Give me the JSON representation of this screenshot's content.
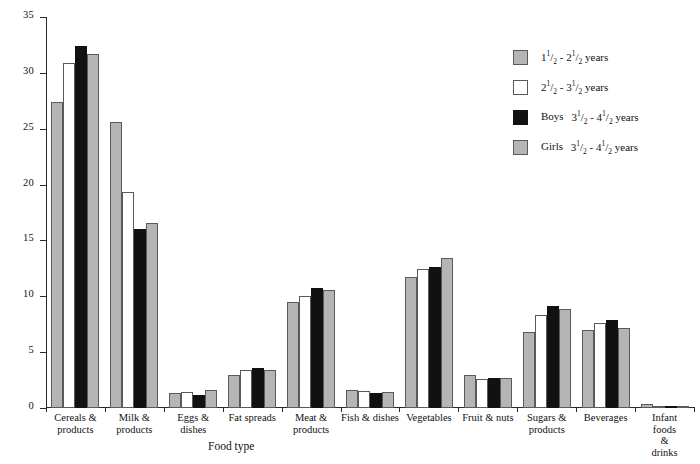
{
  "chart_data": {
    "type": "bar",
    "title": "",
    "xlabel": "Food type",
    "ylabel": "Percentage of energy",
    "ylim": [
      0,
      35
    ],
    "ytick_labels": [
      "0",
      "5",
      "10",
      "15",
      "20",
      "25",
      "30",
      "35"
    ],
    "ytick_values": [
      0,
      5,
      10,
      15,
      20,
      25,
      30,
      35
    ],
    "grid": false,
    "legend_position": "top-right",
    "categories": [
      "Cereals &\nproducts",
      "Milk &\nproducts",
      "Eggs &\ndishes",
      "Fat spreads",
      "Meat &\nproducts",
      "Fish & dishes",
      "Vegetables",
      "Fruit & nuts",
      "Sugars &\nproducts",
      "Beverages",
      "Infant foods\n& drinks"
    ],
    "series": [
      {
        "name": "1½ - 2½ years",
        "prefix": "",
        "num1": "1",
        "den1": "2",
        "whole1": "1",
        "num2": "1",
        "den2": "2",
        "whole2": "2",
        "color": "#b5b5b5",
        "values": [
          27.4,
          25.6,
          1.3,
          3.0,
          9.5,
          1.6,
          11.7,
          3.0,
          6.8,
          7.0,
          0.4
        ]
      },
      {
        "name": "2½ - 3½ years",
        "prefix": "",
        "num1": "1",
        "den1": "2",
        "whole1": "2",
        "num2": "1",
        "den2": "2",
        "whole2": "3",
        "color": "#ffffff",
        "values": [
          30.9,
          19.3,
          1.4,
          3.4,
          10.0,
          1.5,
          12.4,
          2.6,
          8.3,
          7.6,
          0.1
        ]
      },
      {
        "name": "Boys  3½ - 4½ years",
        "prefix": "Boys",
        "num1": "1",
        "den1": "2",
        "whole1": "3",
        "num2": "1",
        "den2": "2",
        "whole2": "4",
        "color": "#111111",
        "values": [
          32.4,
          16.0,
          1.2,
          3.6,
          10.7,
          1.3,
          12.6,
          2.7,
          9.1,
          7.9,
          0.05
        ]
      },
      {
        "name": "Girls  3½ - 4½ years",
        "prefix": "Girls",
        "num1": "1",
        "den1": "2",
        "whole1": "3",
        "num2": "1",
        "den2": "2",
        "whole2": "4",
        "color": "#b5b5b5",
        "values": [
          31.7,
          16.6,
          1.6,
          3.4,
          10.6,
          1.4,
          13.4,
          2.7,
          8.9,
          7.2,
          0.05
        ]
      }
    ],
    "units_suffix": "years",
    "separator": "-"
  }
}
